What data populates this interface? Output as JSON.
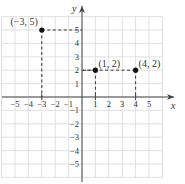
{
  "chart_data": {
    "type": "scatter",
    "title": "",
    "xlabel": "x",
    "ylabel": "y",
    "xlim": [
      -6,
      6
    ],
    "ylim": [
      -6,
      6
    ],
    "grid": true,
    "x_ticks": [
      -5,
      -4,
      -3,
      -2,
      -1,
      1,
      2,
      3,
      4,
      5
    ],
    "y_ticks": [
      -5,
      -4,
      -3,
      -2,
      -1,
      1,
      2,
      3,
      4,
      5
    ],
    "x_tick_labels": [
      "−5",
      "−4",
      "−3",
      "−2",
      "−1",
      "1",
      "2",
      "3",
      "4",
      "5"
    ],
    "y_tick_labels": [
      "−5",
      "−4",
      "−3",
      "−2",
      "−1",
      "1",
      "2",
      "3",
      "4",
      "5"
    ],
    "series": [
      {
        "name": "points",
        "points": [
          {
            "x": -3,
            "y": 5,
            "label": "(−3, 5)"
          },
          {
            "x": 1,
            "y": 2,
            "label": "(1, 2)"
          },
          {
            "x": 4,
            "y": 2,
            "label": "(4, 2)"
          }
        ]
      }
    ],
    "annotations": [
      "dashed projection lines from each point to both axes"
    ]
  },
  "colors": {
    "grid": "#d9d9d9",
    "axis": "#444444",
    "point": "#111111",
    "dash": "#333333",
    "text": "#333333"
  }
}
